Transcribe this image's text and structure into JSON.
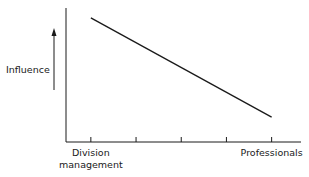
{
  "chart_data": {
    "type": "line",
    "title": "",
    "xlabel": "",
    "ylabel": "Influence",
    "y_arrow": "up",
    "categories": [
      "Division management",
      "",
      "",
      "",
      "Professionals"
    ],
    "category_labels": [
      [
        "Division",
        "management"
      ],
      [],
      [],
      [],
      [
        "Professionals"
      ]
    ],
    "series": [
      {
        "name": "Influence",
        "x": [
          0,
          4
        ],
        "values": [
          1.0,
          0.2
        ]
      }
    ],
    "ylim": [
      0,
      1.08
    ],
    "xlim": [
      -0.55,
      4.65
    ],
    "grid": false,
    "legend": "none"
  },
  "colors": {
    "ink": "#1a1a1a",
    "background": "#ffffff"
  }
}
